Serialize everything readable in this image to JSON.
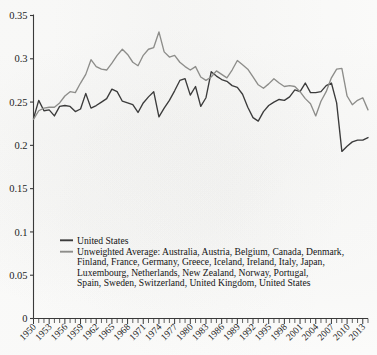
{
  "chart_data": {
    "type": "line",
    "title": "",
    "subtitle": "",
    "xlabel": "",
    "ylabel": "",
    "xlim": [
      1950,
      2014
    ],
    "ylim": [
      0,
      0.35
    ],
    "grid": false,
    "legend_position": "inside-lower-left",
    "y_ticks": [
      "0",
      "0.05",
      "0.1",
      "0.15",
      "0.2",
      "0.25",
      "0.3",
      "0.35"
    ],
    "y_tick_values": [
      0,
      0.05,
      0.1,
      0.15,
      0.2,
      0.25,
      0.3,
      0.35
    ],
    "x_ticks": [
      "1950",
      "1953",
      "1956",
      "1959",
      "1962",
      "1965",
      "1968",
      "1971",
      "1974",
      "1977",
      "1980",
      "1983",
      "1986",
      "1989",
      "1992",
      "1995",
      "1998",
      "2001",
      "2004",
      "2007",
      "2010",
      "2013"
    ],
    "x_tick_values": [
      1950,
      1953,
      1956,
      1959,
      1962,
      1965,
      1968,
      1971,
      1974,
      1977,
      1980,
      1983,
      1986,
      1989,
      1992,
      1995,
      1998,
      2001,
      2004,
      2007,
      2010,
      2013
    ],
    "x_minor_tick_step": 1,
    "x": [
      1950,
      1951,
      1952,
      1953,
      1954,
      1955,
      1956,
      1957,
      1958,
      1959,
      1960,
      1961,
      1962,
      1963,
      1964,
      1965,
      1966,
      1967,
      1968,
      1969,
      1970,
      1971,
      1972,
      1973,
      1974,
      1975,
      1976,
      1977,
      1978,
      1979,
      1980,
      1981,
      1982,
      1983,
      1984,
      1985,
      1986,
      1987,
      1988,
      1989,
      1990,
      1991,
      1992,
      1993,
      1994,
      1995,
      1996,
      1997,
      1998,
      1999,
      2000,
      2001,
      2002,
      2003,
      2004,
      2005,
      2006,
      2007,
      2008,
      2009,
      2010,
      2011,
      2012,
      2013,
      2014
    ],
    "series": [
      {
        "name": "United States",
        "color": "#3b3b3b",
        "values": [
          0.231,
          0.252,
          0.24,
          0.241,
          0.234,
          0.245,
          0.246,
          0.245,
          0.239,
          0.242,
          0.26,
          0.243,
          0.246,
          0.25,
          0.254,
          0.265,
          0.262,
          0.251,
          0.249,
          0.247,
          0.238,
          0.249,
          0.256,
          0.262,
          0.233,
          0.243,
          0.252,
          0.263,
          0.275,
          0.277,
          0.258,
          0.268,
          0.245,
          0.255,
          0.285,
          0.28,
          0.276,
          0.274,
          0.269,
          0.267,
          0.259,
          0.244,
          0.232,
          0.228,
          0.239,
          0.246,
          0.25,
          0.253,
          0.252,
          0.256,
          0.264,
          0.262,
          0.272,
          0.261,
          0.261,
          0.262,
          0.269,
          0.272,
          0.249,
          0.193,
          0.199,
          0.204,
          0.206,
          0.206,
          0.209
        ]
      },
      {
        "name": "Unweighted Average: Australia, Austria, Belgium, Canada, Denmark, Finland, France, Germany, Greece, Iceland, Ireland, Italy, Japan, Luxembourg, Netherlands, New Zealand, Norway, Portugal, Spain, Sweden, Switzerland, United Kingdom, United States",
        "color": "#8d8d8a",
        "values": [
          0.23,
          0.24,
          0.243,
          0.244,
          0.244,
          0.249,
          0.257,
          0.262,
          0.261,
          0.272,
          0.282,
          0.299,
          0.291,
          0.288,
          0.287,
          0.295,
          0.304,
          0.311,
          0.305,
          0.296,
          0.292,
          0.304,
          0.311,
          0.313,
          0.331,
          0.308,
          0.302,
          0.304,
          0.296,
          0.291,
          0.287,
          0.291,
          0.279,
          0.275,
          0.279,
          0.286,
          0.282,
          0.278,
          0.287,
          0.298,
          0.293,
          0.288,
          0.279,
          0.27,
          0.266,
          0.271,
          0.277,
          0.272,
          0.268,
          0.269,
          0.268,
          0.262,
          0.254,
          0.248,
          0.234,
          0.251,
          0.262,
          0.278,
          0.288,
          0.289,
          0.257,
          0.247,
          0.252,
          0.255,
          0.241
        ]
      }
    ],
    "legend": [
      {
        "label": "United States",
        "color": "#3b3b3b",
        "lines": [
          "United States"
        ]
      },
      {
        "label": "Unweighted Average: Australia, Austria, Belgium, Canada, Denmark, Finland, France, Germany, Greece, Iceland, Ireland, Italy, Japan, Luxembourg, Netherlands, New Zealand, Norway, Portugal, Spain, Sweden, Switzerland, United Kingdom, United States",
        "color": "#8d8d8a",
        "lines": [
          "Unweighted Average: Australia, Austria, Belgium, Canada, Denmark,",
          "Finland, France, Germany, Greece, Iceland, Ireland, Italy, Japan,",
          "Luxembourg, Netherlands, New Zealand, Norway, Portugal,",
          "Spain, Sweden, Switzerland, United Kingdom, United States"
        ]
      }
    ]
  },
  "colors": {
    "background": "#fdfdfc",
    "axis": "#3a3a3a",
    "text": "#1d1d1d",
    "series_us": "#3b3b3b",
    "series_avg": "#8d8d8a"
  }
}
